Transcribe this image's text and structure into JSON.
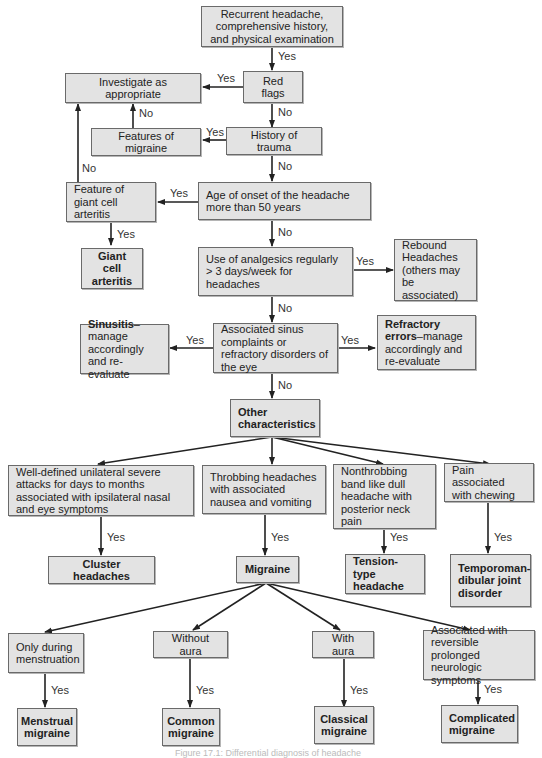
{
  "diagram": {
    "type": "flowchart",
    "title": "Differential diagnosis of headache",
    "nodes": {
      "start": "Recurrent headache, comprehensive history, and physical examination",
      "red_flags": "Red flags",
      "investigate": "Investigate as appropriate",
      "trauma": "History of trauma",
      "features_migraine": "Features of migraine",
      "age_onset": "Age of onset of the headache more than 50 years",
      "giant_cell_feature": "Feature of giant cell arteritis",
      "giant_cell": "Giant cell arteritis",
      "analgesics": "Use of analgesics regularly > 3 days/week for headaches",
      "rebound": "Rebound Headaches (others may be associated)",
      "sinus": "Associated sinus complaints or refractory disorders of the eye",
      "sinusitis_bold": "Sinusitis",
      "sinusitis_rest": "–manage accordingly and re-evaluate",
      "refractory_bold": "Refractory errors",
      "refractory_rest": "–manage accordingly and re-evaluate",
      "other": "Other characteristics",
      "unilateral": "Well-defined unilateral severe attacks for days to months associated with ipsilateral nasal and eye symptoms",
      "throbbing": "Throbbing headaches with associated nausea and vomiting",
      "nonthrobbing": "Nonthrobbing band like dull headache with posterior neck pain",
      "chewing": "Pain associated with chewing",
      "cluster": "Cluster headaches",
      "migraine": "Migraine",
      "tension": "Tension-type headache",
      "tmj": "Temporoman-dibular joint disorder",
      "menstruation": "Only during menstruation",
      "without_aura": "Without aura",
      "with_aura": "With aura",
      "neuro": "Associated with reversible prolonged neurologic symptoms",
      "menstrual_migraine": "Menstrual migraine",
      "common_migraine": "Common migraine",
      "classical_migraine": "Classical migraine",
      "complicated_migraine": "Complicated migraine"
    },
    "edge_labels": {
      "yes": "Yes",
      "no": "No"
    },
    "caption": "Figure 17.1: Differential diagnosis of headache"
  }
}
